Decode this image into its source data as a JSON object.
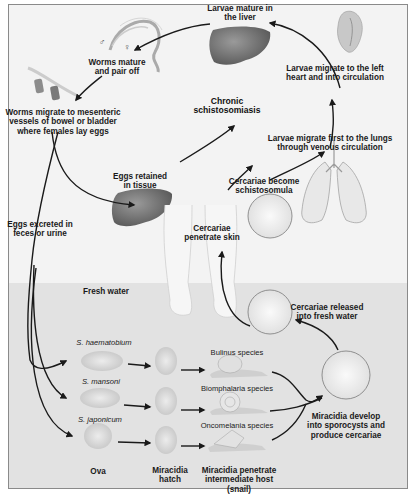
{
  "diagram": {
    "colors": {
      "background": "#f3f3f3",
      "fresh_water": "#e2e2e2",
      "frame_border": "#8a8a8a",
      "arrow": "#1a1a1a",
      "organ_liver": "#6e6e6e",
      "text": "#1a1a1a"
    },
    "regions": {
      "fresh_water_label": "Fresh water"
    },
    "human_stages": {
      "larvae_liver": [
        "Larvae mature in",
        "the liver"
      ],
      "worms_pair": [
        "Worms mature",
        "and pair off"
      ],
      "male_symbol": "♂",
      "female_symbol": "♀",
      "worms_migrate": [
        "Worms migrate to mesenteric",
        "vessels of bowel or bladder",
        "where females lay eggs"
      ],
      "larvae_heart": [
        "Larvae migrate to the left",
        "heart and into circulation"
      ],
      "chronic": [
        "Chronic",
        "schistosomiasis"
      ],
      "larvae_lungs": [
        "Larvae migrate first to the lungs",
        "through venous circulation"
      ],
      "eggs_retained": [
        "Eggs retained",
        "in tissue"
      ],
      "cercariae_become": [
        "Cercariae become",
        "schistosomula"
      ],
      "eggs_excreted": [
        "Eggs excreted in",
        "feces or urine"
      ],
      "cercariae_penetrate": [
        "Cercariae",
        "penetrate skin"
      ]
    },
    "water_stages": {
      "cercariae_released": [
        "Cercariae released",
        "into fresh water"
      ],
      "species": [
        {
          "name": "S. haematobium",
          "host": "Bulinus species"
        },
        {
          "name": "S. mansoni",
          "host": "Biomphalaria species"
        },
        {
          "name": "S. japonicum",
          "host": "Oncomelania species"
        }
      ],
      "miracidia_develop": [
        "Miracidia develop",
        "into sporocysts and",
        "produce cercariae"
      ],
      "ova_label": "Ova",
      "miracidia_hatch": [
        "Miracidia",
        "hatch"
      ],
      "miracidia_penetrate": [
        "Miracidia penetrate",
        "intermediate host",
        "(snail)"
      ]
    }
  }
}
